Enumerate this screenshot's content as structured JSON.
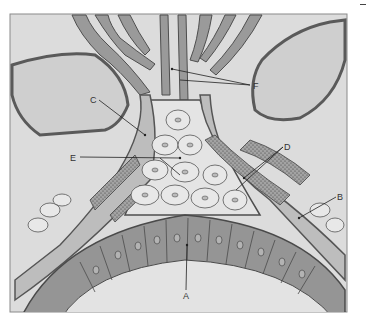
{
  "figure": {
    "type": "histology-diagram",
    "colors": {
      "background_frame": "#d9d9d9",
      "lumen_fill": "#e6e6e6",
      "dark_cell": "#8c8c8c",
      "mid_cell": "#a6a6a6",
      "light_cell": "#e2e2e2",
      "stippled_cell": "#9a9a9a",
      "outline": "#505050"
    },
    "labels": [
      {
        "id": "A",
        "text": "A",
        "x": 186,
        "y": 299,
        "target_x": 187,
        "target_y": 245
      },
      {
        "id": "B",
        "text": "B",
        "x": 339,
        "y": 199,
        "target_x": 299,
        "target_y": 218
      },
      {
        "id": "C",
        "text": "C",
        "x": 93,
        "y": 102,
        "target_x": 145,
        "target_y": 135
      },
      {
        "id": "D",
        "text": "D",
        "x": 285,
        "y": 149,
        "target_x": 244,
        "target_y": 178
      },
      {
        "id": "E",
        "text": "E",
        "x": 73,
        "y": 160,
        "target_x": 180,
        "target_y": 158
      },
      {
        "id": "F",
        "text": "F",
        "x": 253,
        "y": 88,
        "target_x": 172,
        "target_y": 69
      }
    ]
  }
}
